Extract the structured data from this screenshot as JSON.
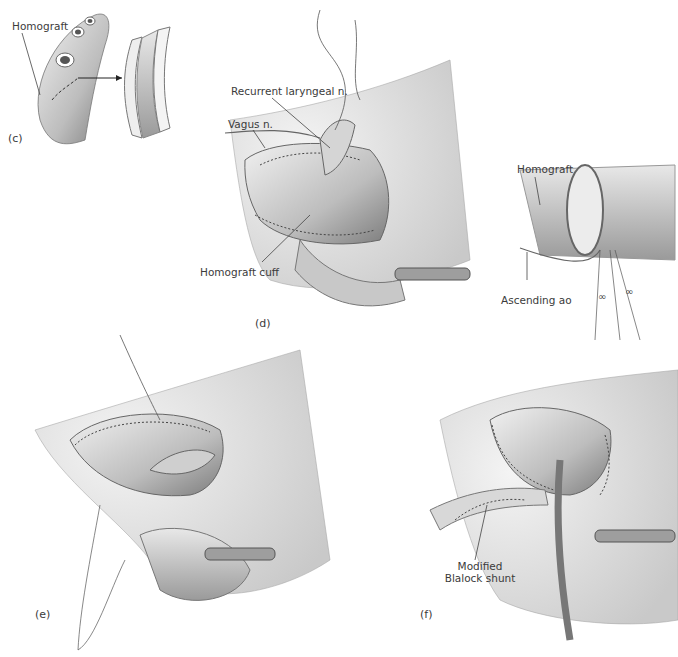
{
  "figure": {
    "panels": [
      {
        "id": "c",
        "letter": "(c)",
        "labels": [
          "Homograft"
        ]
      },
      {
        "id": "d",
        "letter": "(d)",
        "labels": [
          "Recurrent laryngeal n.",
          "Vagus n.",
          "Homograft cuff",
          "Homograft",
          "Ascending ao"
        ]
      },
      {
        "id": "e",
        "letter": "(e)",
        "labels": []
      },
      {
        "id": "f",
        "letter": "(f)",
        "labels": [
          "Modified",
          "Blalock shunt"
        ]
      }
    ]
  },
  "colors": {
    "background": "#ffffff",
    "ink": "#3b3b3b",
    "tissue_light": "#d9d9d9",
    "tissue_mid": "#a8a8a8",
    "tissue_dark": "#6e6e6e"
  }
}
